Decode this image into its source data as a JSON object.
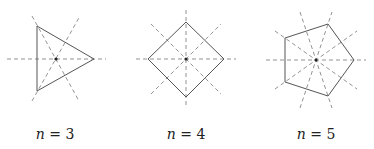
{
  "figure": {
    "panels": [
      {
        "id": "triangle",
        "n": 3,
        "label_var": "n",
        "label_eq": " = ",
        "label_val": "3",
        "center": [
          56,
          59
        ],
        "vertices": [
          [
            94,
            59
          ],
          [
            37,
            26
          ],
          [
            37,
            91
          ]
        ],
        "axes": [
          [
            [
              7,
              59
            ],
            [
              106,
              59
            ]
          ],
          [
            [
              32,
              16
            ],
            [
              79,
              101
            ]
          ],
          [
            [
              32,
              101
            ],
            [
              80,
              16
            ]
          ]
        ]
      },
      {
        "id": "square",
        "n": 4,
        "label_var": "n",
        "label_eq": " = ",
        "label_val": "4",
        "center": [
          186,
          59
        ],
        "vertices": [
          [
            186,
            22
          ],
          [
            224,
            59
          ],
          [
            186,
            97
          ],
          [
            148,
            59
          ]
        ],
        "axes": [
          [
            [
              136,
              59
            ],
            [
              236,
              59
            ]
          ],
          [
            [
              186,
              10
            ],
            [
              186,
              108
            ]
          ],
          [
            [
              151,
              24
            ],
            [
              221,
              94
            ]
          ],
          [
            [
              151,
              94
            ],
            [
              221,
              24
            ]
          ]
        ]
      },
      {
        "id": "pentagon",
        "n": 5,
        "label_var": "n",
        "label_eq": " = ",
        "label_val": "5",
        "center": [
          316,
          60
        ],
        "vertices": [
          [
            354,
            60
          ],
          [
            328,
            24
          ],
          [
            285,
            38
          ],
          [
            285,
            82
          ],
          [
            328,
            96
          ]
        ],
        "axes": [
          [
            [
              266,
              60
            ],
            [
              366,
              60
            ]
          ],
          [
            [
              300,
              12
            ],
            [
              332,
              108
            ]
          ],
          [
            [
              300,
              108
            ],
            [
              332,
              12
            ]
          ],
          [
            [
              275,
              31
            ],
            [
              357,
              89
            ]
          ],
          [
            [
              275,
              89
            ],
            [
              357,
              31
            ]
          ]
        ]
      }
    ],
    "labels": [
      "n = 3",
      "n = 4",
      "n = 5"
    ],
    "colors": {
      "polygon": "#555555",
      "axis": "#777777",
      "center": "#222222"
    }
  }
}
